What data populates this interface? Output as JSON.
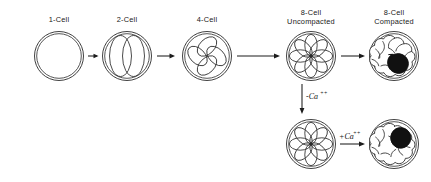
{
  "figure": {
    "background_color": "#ffffff",
    "line_color": "#2b2b2b",
    "dark_cell_color": "#111111"
  },
  "stages": [
    {
      "id": "one-cell",
      "label": "1-Cell",
      "cell_count": 1,
      "row": "top",
      "cx": 59,
      "cy": 56,
      "zona_r": 25,
      "appearance": "single round zygote with zona pellucida, no internal blastomere outlines"
    },
    {
      "id": "two-cell",
      "label": "2-Cell",
      "cell_count": 2,
      "row": "top",
      "cx": 127,
      "cy": 56,
      "zona_r": 25,
      "appearance": "two overlapping vertical blastomeres inside zona"
    },
    {
      "id": "four-cell",
      "label": "4-Cell",
      "cell_count": 4,
      "row": "top",
      "cx": 207,
      "cy": 56,
      "zona_r": 25,
      "appearance": "four petal-like blastomeres in cloverleaf rosette"
    },
    {
      "id": "eight-cell-uncompacted",
      "label": "8-Cell\nUncompacted",
      "label_line1": "8-Cell",
      "label_line2": "Uncompacted",
      "cell_count": 8,
      "row": "top",
      "cx": 311,
      "cy": 56,
      "zona_r": 25,
      "appearance": "eight petal blastomeres in open rosette, individual outlines distinct"
    },
    {
      "id": "eight-cell-compacted",
      "label": "8-Cell\nCompacted",
      "label_line1": "8-Cell",
      "label_line2": "Compacted",
      "cell_count": 8,
      "row": "top",
      "cx": 394,
      "cy": 56,
      "zona_r": 25,
      "dark_cell_position": "lower-right",
      "appearance": "compacted morula with smooth lobed outline, one blastomere filled black"
    },
    {
      "id": "eight-cell-decompacted",
      "label": "",
      "cell_count": 8,
      "row": "bottom",
      "cx": 311,
      "cy": 144,
      "zona_r": 25,
      "appearance": "decompacted eight-cell rosette after calcium removal"
    },
    {
      "id": "eight-cell-recompacted",
      "label": "",
      "cell_count": 8,
      "row": "bottom",
      "cx": 394,
      "cy": 144,
      "zona_r": 25,
      "dark_cell_position": "upper-right",
      "appearance": "recompacted morula after calcium restored, one blastomere filled black"
    }
  ],
  "arrows": [
    {
      "id": "arrow-1to2",
      "from": "one-cell",
      "to": "two-cell",
      "direction": "right",
      "label": ""
    },
    {
      "id": "arrow-2to4",
      "from": "two-cell",
      "to": "four-cell",
      "direction": "right",
      "label": ""
    },
    {
      "id": "arrow-4to8",
      "from": "four-cell",
      "to": "eight-cell-uncompacted",
      "direction": "right",
      "label": ""
    },
    {
      "id": "arrow-8uncomp-to-8comp",
      "from": "eight-cell-uncompacted",
      "to": "eight-cell-compacted",
      "direction": "right",
      "label": ""
    },
    {
      "id": "arrow-minus-calcium",
      "from": "eight-cell-uncompacted",
      "to": "eight-cell-decompacted",
      "direction": "down",
      "label": "-Ca++",
      "label_base": "-Ca",
      "label_sup": "++"
    },
    {
      "id": "arrow-plus-calcium",
      "from": "eight-cell-decompacted",
      "to": "eight-cell-recompacted",
      "direction": "right",
      "label": "+Ca++",
      "label_base": "+Ca",
      "label_sup": "++"
    }
  ],
  "annotations": {
    "minus_calcium": {
      "base": "-Ca",
      "superscript": "++"
    },
    "plus_calcium": {
      "base": "+Ca",
      "superscript": "++"
    }
  }
}
